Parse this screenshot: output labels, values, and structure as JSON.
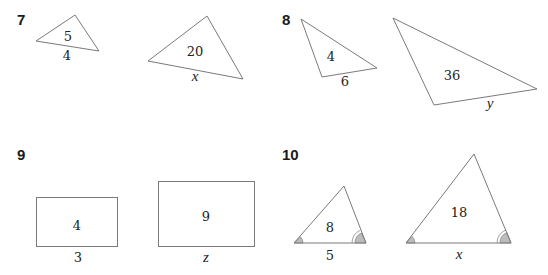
{
  "problems": [
    {
      "number": "7",
      "shapes": "triangles",
      "small": {
        "area": "5",
        "side": "4"
      },
      "large": {
        "area": "20",
        "side": "x"
      }
    },
    {
      "number": "8",
      "shapes": "triangles",
      "small": {
        "area": "4",
        "side": "6"
      },
      "large": {
        "area": "36",
        "side": "y"
      }
    },
    {
      "number": "9",
      "shapes": "rectangles",
      "small": {
        "area": "4",
        "side": "3"
      },
      "large": {
        "area": "9",
        "side": "z"
      }
    },
    {
      "number": "10",
      "shapes": "triangles with matching angle marks",
      "small": {
        "area": "8",
        "side": "5"
      },
      "large": {
        "area": "18",
        "side": "x"
      }
    }
  ],
  "colors": {
    "outline": "#7a7a7a",
    "angle_fill": "#bcbcbc",
    "text": "#1a1a1a"
  }
}
